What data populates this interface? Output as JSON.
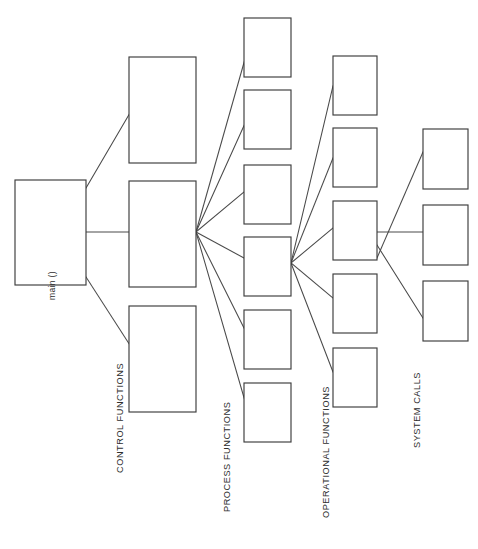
{
  "diagram": {
    "background_color": "#ffffff",
    "stroke_color": "#3c3c3c",
    "line_color": "#4a4a4a",
    "text_color": "#2e2e2e",
    "width": 478,
    "height": 549,
    "label_rotation_deg": -90,
    "labels": {
      "main": "main ()",
      "control": "CONTROL FUNCTIONS",
      "process": "PROCESS FUNCTIONS",
      "operational": "OPERATIONAL FUNCTIONS",
      "system": "SYSTEM CALLS"
    },
    "label_positions": {
      "main": {
        "x": 55,
        "y": 300
      },
      "control": {
        "x": 123,
        "y": 473
      },
      "process": {
        "x": 230,
        "y": 512
      },
      "operational": {
        "x": 329,
        "y": 518
      },
      "system": {
        "x": 420,
        "y": 448
      }
    },
    "columns": [
      {
        "id": "col-main",
        "name": "main",
        "label": "main ()",
        "box_width": 71,
        "box_height": 105,
        "boxes": [
          {
            "id": "main-1",
            "x": 15,
            "y": 180
          }
        ]
      },
      {
        "id": "col-control",
        "name": "control-functions",
        "label": "CONTROL FUNCTIONS",
        "box_width": 67,
        "box_height": 106,
        "boxes": [
          {
            "id": "ctrl-1",
            "x": 129,
            "y": 57
          },
          {
            "id": "ctrl-2",
            "x": 129,
            "y": 181
          },
          {
            "id": "ctrl-3",
            "x": 129,
            "y": 306
          }
        ]
      },
      {
        "id": "col-process",
        "name": "process-functions",
        "label": "PROCESS FUNCTIONS",
        "box_width": 47,
        "box_height": 59,
        "boxes": [
          {
            "id": "proc-1",
            "x": 244,
            "y": 18
          },
          {
            "id": "proc-2",
            "x": 244,
            "y": 90
          },
          {
            "id": "proc-3",
            "x": 244,
            "y": 165
          },
          {
            "id": "proc-4",
            "x": 244,
            "y": 237
          },
          {
            "id": "proc-5",
            "x": 244,
            "y": 310
          },
          {
            "id": "proc-6",
            "x": 244,
            "y": 383
          }
        ]
      },
      {
        "id": "col-operational",
        "name": "operational-functions",
        "label": "OPERATIONAL FUNCTIONS",
        "box_width": 44,
        "box_height": 59,
        "boxes": [
          {
            "id": "oper-1",
            "x": 333,
            "y": 56
          },
          {
            "id": "oper-2",
            "x": 333,
            "y": 128
          },
          {
            "id": "oper-3",
            "x": 333,
            "y": 201
          },
          {
            "id": "oper-4",
            "x": 333,
            "y": 274
          },
          {
            "id": "oper-5",
            "x": 333,
            "y": 348
          }
        ]
      },
      {
        "id": "col-system",
        "name": "system-calls",
        "label": "SYSTEM CALLS",
        "box_width": 45,
        "box_height": 60,
        "boxes": [
          {
            "id": "sys-1",
            "x": 423,
            "y": 129
          },
          {
            "id": "sys-2",
            "x": 423,
            "y": 205
          },
          {
            "id": "sys-3",
            "x": 423,
            "y": 281
          }
        ]
      }
    ],
    "links": [
      {
        "id": "l1",
        "from": "main-1",
        "to": "ctrl-1",
        "x1": 86,
        "y1": 188,
        "x2": 137,
        "y2": 101
      },
      {
        "id": "l2",
        "from": "main-1",
        "to": "ctrl-2",
        "x1": 86,
        "y1": 232,
        "x2": 129,
        "y2": 232
      },
      {
        "id": "l3",
        "from": "main-1",
        "to": "ctrl-3",
        "x1": 86,
        "y1": 277,
        "x2": 137,
        "y2": 356
      },
      {
        "id": "l4",
        "from": "ctrl-2",
        "to": "proc-1",
        "x1": 196,
        "y1": 232,
        "x2": 247,
        "y2": 52
      },
      {
        "id": "l5",
        "from": "ctrl-2",
        "to": "proc-2",
        "x1": 196,
        "y1": 232,
        "x2": 247,
        "y2": 119
      },
      {
        "id": "l6",
        "from": "ctrl-2",
        "to": "proc-3",
        "x1": 196,
        "y1": 232,
        "x2": 244,
        "y2": 192
      },
      {
        "id": "l7",
        "from": "ctrl-2",
        "to": "proc-4",
        "x1": 196,
        "y1": 232,
        "x2": 244,
        "y2": 258
      },
      {
        "id": "l8",
        "from": "ctrl-2",
        "to": "proc-5",
        "x1": 196,
        "y1": 232,
        "x2": 247,
        "y2": 334
      },
      {
        "id": "l9",
        "from": "ctrl-2",
        "to": "proc-6",
        "x1": 196,
        "y1": 232,
        "x2": 247,
        "y2": 408
      },
      {
        "id": "l10",
        "from": "proc-4",
        "to": "oper-1",
        "x1": 291,
        "y1": 263,
        "x2": 333,
        "y2": 86
      },
      {
        "id": "l11",
        "from": "proc-4",
        "to": "oper-2",
        "x1": 291,
        "y1": 263,
        "x2": 333,
        "y2": 158
      },
      {
        "id": "l12",
        "from": "proc-4",
        "to": "oper-3",
        "x1": 291,
        "y1": 263,
        "x2": 333,
        "y2": 228
      },
      {
        "id": "l13",
        "from": "proc-4",
        "to": "oper-4",
        "x1": 291,
        "y1": 263,
        "x2": 333,
        "y2": 298
      },
      {
        "id": "l14",
        "from": "proc-4",
        "to": "oper-5",
        "x1": 291,
        "y1": 263,
        "x2": 333,
        "y2": 372
      },
      {
        "id": "l15",
        "from": "oper-3",
        "to": "sys-1",
        "x1": 377,
        "y1": 258,
        "x2": 423,
        "y2": 152
      },
      {
        "id": "l16",
        "from": "oper-3",
        "to": "sys-2",
        "x1": 377,
        "y1": 232,
        "x2": 423,
        "y2": 232
      },
      {
        "id": "l17",
        "from": "oper-3",
        "to": "sys-3",
        "x1": 377,
        "y1": 245,
        "x2": 423,
        "y2": 318
      }
    ]
  }
}
